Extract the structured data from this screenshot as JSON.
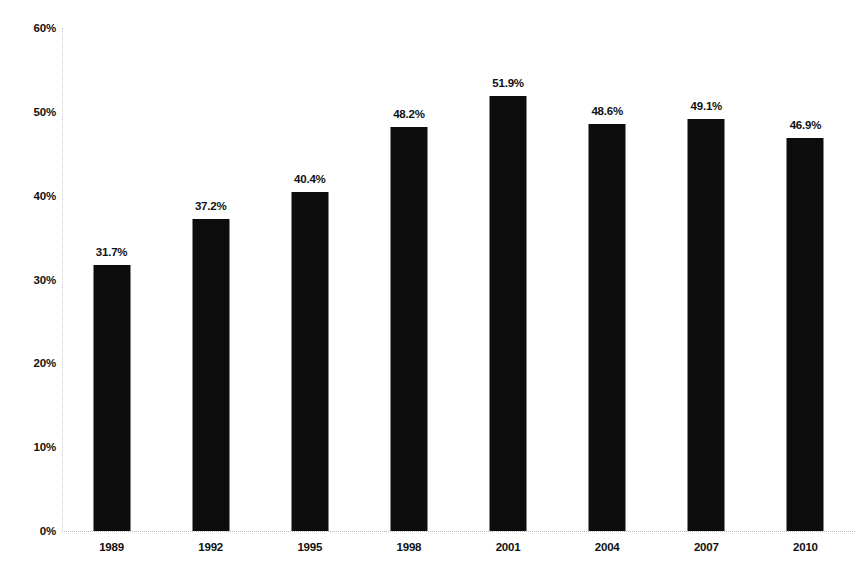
{
  "chart_data": {
    "type": "bar",
    "title": "",
    "subtitle": "",
    "xlabel": "",
    "ylabel": "",
    "categories": [
      "1989",
      "1992",
      "1995",
      "1998",
      "2001",
      "2004",
      "2007",
      "2010"
    ],
    "values": [
      31.7,
      37.2,
      40.4,
      48.2,
      51.9,
      48.6,
      49.1,
      46.9
    ],
    "data_labels": [
      "31.7%",
      "37.2%",
      "40.4%",
      "48.2%",
      "51.9%",
      "48.6%",
      "49.1%",
      "46.9%"
    ],
    "ylim": [
      0,
      60
    ],
    "y_ticks": [
      0,
      10,
      20,
      30,
      40,
      50,
      60
    ],
    "y_tick_labels": [
      "0%",
      "10%",
      "20%",
      "30%",
      "40%",
      "50%",
      "60%"
    ],
    "grid": false,
    "legend": null,
    "bar_color": "#0d0d0d",
    "axis_color": "#c9c9c9",
    "text_color": "#111111"
  }
}
